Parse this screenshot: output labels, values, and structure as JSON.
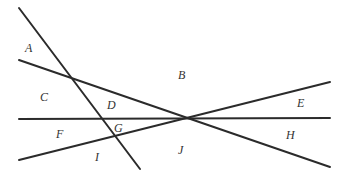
{
  "diagram": {
    "line_color": "#2b2b2b",
    "lines": [
      {
        "id": "line-1",
        "x1": 19,
        "y1": 8,
        "x2": 140,
        "y2": 169
      },
      {
        "id": "line-2",
        "x1": 19,
        "y1": 60,
        "x2": 330,
        "y2": 167
      },
      {
        "id": "line-3",
        "x1": 19,
        "y1": 119,
        "x2": 330,
        "y2": 118
      },
      {
        "id": "line-4",
        "x1": 19,
        "y1": 160,
        "x2": 330,
        "y2": 82
      }
    ],
    "regions": [
      {
        "label": "A",
        "x": 25,
        "y": 52
      },
      {
        "label": "B",
        "x": 178,
        "y": 79
      },
      {
        "label": "C",
        "x": 40,
        "y": 101
      },
      {
        "label": "D",
        "x": 107,
        "y": 109
      },
      {
        "label": "E",
        "x": 297,
        "y": 107
      },
      {
        "label": "F",
        "x": 56,
        "y": 138
      },
      {
        "label": "G",
        "x": 114,
        "y": 132
      },
      {
        "label": "H",
        "x": 286,
        "y": 139
      },
      {
        "label": "I",
        "x": 95,
        "y": 161
      },
      {
        "label": "J",
        "x": 178,
        "y": 154
      }
    ]
  }
}
